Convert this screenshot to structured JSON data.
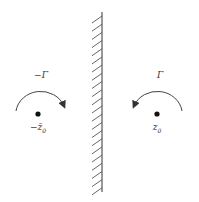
{
  "figure": {
    "colors": {
      "stroke": "#444444",
      "text": "#333333",
      "background": "#ffffff"
    },
    "wall": {
      "x": 102,
      "y_top": 12,
      "y_bottom": 192,
      "hatch_side": "left",
      "hatch_count": 22
    },
    "left_vortex": {
      "circulation_label": "−Γ",
      "position_label": "−z̄₀",
      "position_label_main": "−z̄",
      "position_label_sub": "0",
      "rotation": "clockwise",
      "center": [
        38,
        114
      ]
    },
    "right_vortex": {
      "circulation_label": "Γ",
      "position_label": "z₀",
      "position_label_main": "z",
      "position_label_sub": "0",
      "rotation": "counterclockwise",
      "center": [
        157,
        114
      ]
    }
  }
}
